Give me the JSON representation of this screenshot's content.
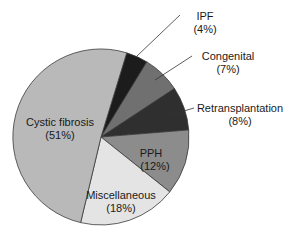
{
  "chart_data": {
    "type": "pie",
    "title": "",
    "start_angle_deg": 17,
    "direction": "clockwise",
    "slices": [
      {
        "label": "IPF",
        "pct_label": "(4%)",
        "value": 4,
        "color": "#1c1c1c"
      },
      {
        "label": "Congenital",
        "pct_label": "(7%)",
        "value": 7,
        "color": "#707070"
      },
      {
        "label": "Retransplantation",
        "pct_label": "(8%)",
        "value": 8,
        "color": "#2f2f2f"
      },
      {
        "label": "PPH",
        "pct_label": "(12%)",
        "value": 12,
        "color": "#8c8c8c"
      },
      {
        "label": "Miscellaneous",
        "pct_label": "(18%)",
        "value": 18,
        "color": "#e4e4e4"
      },
      {
        "label": "Cystic fibrosis",
        "pct_label": "(51%)",
        "value": 51,
        "color": "#b9b9b9"
      }
    ],
    "legend": "none (callout labels)"
  },
  "labels": {
    "ipf": {
      "name": "IPF",
      "pct": "(4%)"
    },
    "congenital": {
      "name": "Congenital",
      "pct": "(7%)"
    },
    "retransplantation": {
      "name": "Retransplantation",
      "pct": "(8%)"
    },
    "pph": {
      "name": "PPH",
      "pct": "(12%)"
    },
    "miscellaneous": {
      "name": "Miscellaneous",
      "pct": "(18%)"
    },
    "cystic_fibrosis": {
      "name": "Cystic fibrosis",
      "pct": "(51%)"
    }
  }
}
